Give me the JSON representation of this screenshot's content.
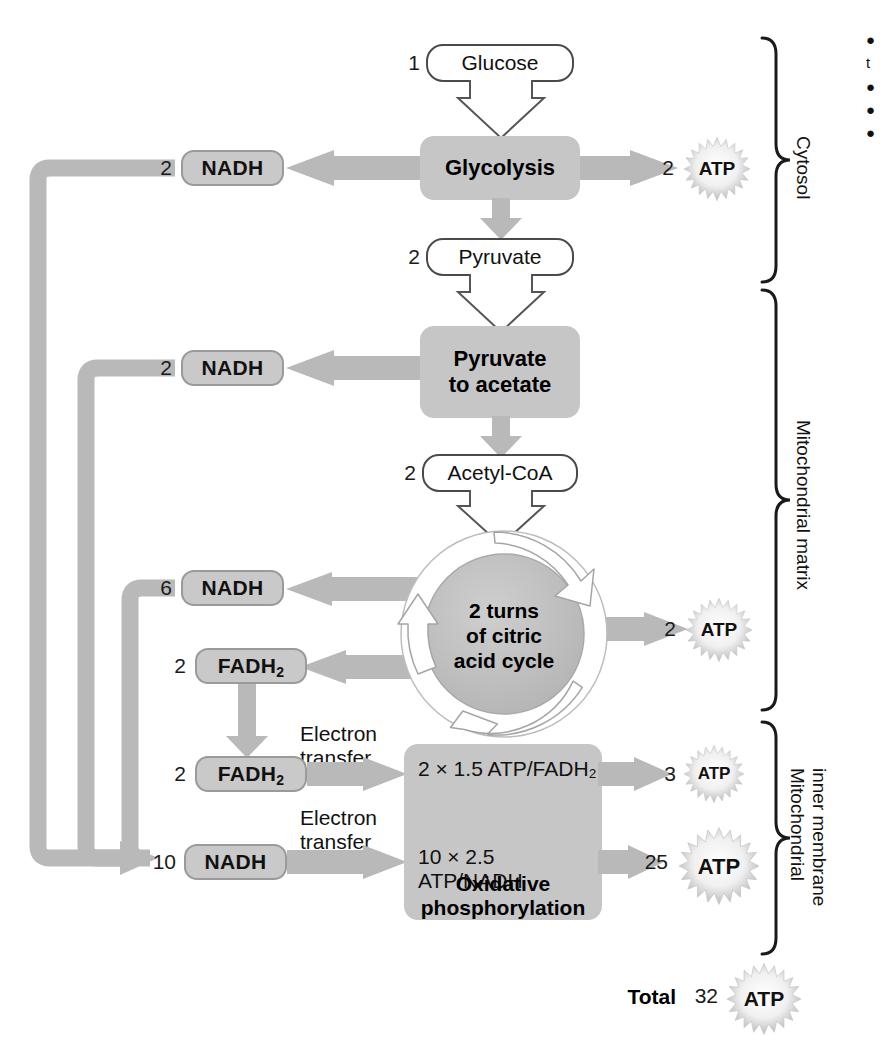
{
  "figure": {
    "type": "metabolic-pathway-flow-diagram"
  },
  "colors": {
    "arrow_gray": "#b9b9b9",
    "process_gray": "#c6c6c6",
    "carrier_gray": "#c9c9c9",
    "cycle_gray": "#bdbdbd",
    "outline": "#4a4a4a",
    "text": "#111111"
  },
  "nodes": {
    "glucose": {
      "count": "1",
      "label": "Glucose"
    },
    "glycolysis": {
      "label": "Glycolysis"
    },
    "pyruvate": {
      "count": "2",
      "label": "Pyruvate"
    },
    "pyruvate_to_acetate": {
      "label_line1": "Pyruvate",
      "label_line2": "to acetate"
    },
    "acetyl_coa": {
      "count": "2",
      "label": "Acetyl-CoA"
    },
    "citric_cycle": {
      "line1": "2 turns",
      "line2": "of citric",
      "line3": "acid cycle"
    },
    "oxidative_phosphorylation": {
      "fadh2_equation": "2 × 1.5 ATP/FADH₂",
      "nadh_equation": "10 × 2.5 ATP/NADH",
      "label_line1": "Oxidative",
      "label_line2": "phosphorylation"
    }
  },
  "carriers": [
    {
      "name": "nadh-glycolysis",
      "count": "2",
      "label": "NADH",
      "sub": ""
    },
    {
      "name": "nadh-pyruvate",
      "count": "2",
      "label": "NADH",
      "sub": ""
    },
    {
      "name": "nadh-citric",
      "count": "6",
      "label": "NADH",
      "sub": ""
    },
    {
      "name": "fadh2-citric",
      "count": "2",
      "label": "FADH",
      "sub": "2"
    },
    {
      "name": "fadh2-etc",
      "count": "2",
      "label": "FADH",
      "sub": "2"
    },
    {
      "name": "nadh-etc",
      "count": "10",
      "label": "NADH",
      "sub": ""
    }
  ],
  "atp_outputs": [
    {
      "name": "atp-glycolysis",
      "count": "2",
      "label": "ATP"
    },
    {
      "name": "atp-citric-cycle",
      "count": "2",
      "label": "ATP"
    },
    {
      "name": "atp-fadh2",
      "count": "3",
      "label": "ATP"
    },
    {
      "name": "atp-nadh",
      "count": "25",
      "label": "ATP"
    },
    {
      "name": "atp-total",
      "count": "32",
      "label": "ATP"
    }
  ],
  "total": {
    "label": "Total",
    "count": "32",
    "unit": "ATP"
  },
  "electron_transfer_labels": [
    {
      "line1": "Electron",
      "line2": "transfer"
    },
    {
      "line1": "Electron",
      "line2": "transfer"
    }
  ],
  "compartments": [
    {
      "name": "cytosol",
      "label": "Cytosol"
    },
    {
      "name": "mitochondrial-matrix",
      "label": "Mitochondrial matrix"
    },
    {
      "name": "mitochondrial-inner-membrane",
      "label_line1": "Mitochondrial",
      "label_line2": "inner membrane"
    }
  ],
  "margin_caption": {
    "lines": [
      "●",
      "t",
      "●",
      "●",
      "●"
    ]
  }
}
